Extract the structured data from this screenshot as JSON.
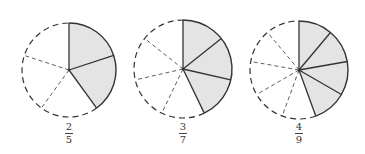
{
  "colors": {
    "shade": "#e4e4e4",
    "stroke": "#333333",
    "background": "#ffffff"
  },
  "diagrams": [
    {
      "id": "two-fifths",
      "parts": 5,
      "shaded": 2,
      "cx": 69,
      "cy": 70,
      "r": 47,
      "label": {
        "numerator": "2",
        "denominator": "5"
      },
      "label_x": 57,
      "label_y": 124
    },
    {
      "id": "three-sevenths",
      "parts": 7,
      "shaded": 3,
      "cx": 183,
      "cy": 69,
      "r": 49,
      "label": {
        "numerator": "3",
        "denominator": "7"
      },
      "label_x": 171,
      "label_y": 124
    },
    {
      "id": "four-ninths",
      "parts": 9,
      "shaded": 4,
      "cx": 299,
      "cy": 70,
      "r": 49,
      "label": {
        "numerator": "4",
        "denominator": "9"
      },
      "label_x": 287,
      "label_y": 124
    }
  ]
}
